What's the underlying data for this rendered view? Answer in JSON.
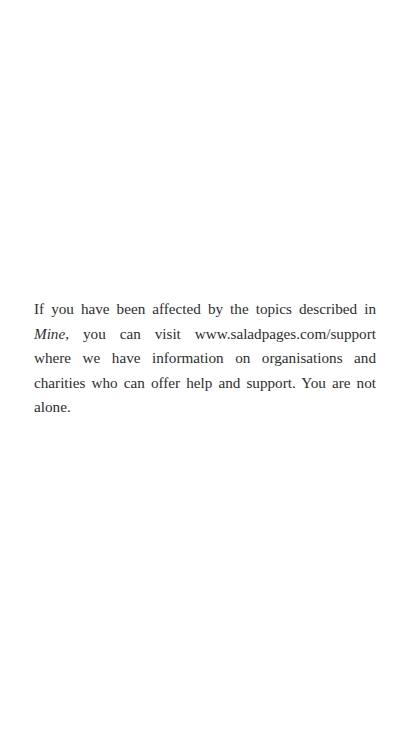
{
  "page": {
    "notice": {
      "text_before_title": "If you have been affected by the topics described in ",
      "book_title": "Mine",
      "text_after_title": ", you can visit www.saladpages.com/support where we have information on organisations and charities who can offer help and support. You are not alone.",
      "url": "www.saladpages.com/support"
    },
    "colors": {
      "background": "#ffffff",
      "text": "#2e2e2e"
    }
  }
}
